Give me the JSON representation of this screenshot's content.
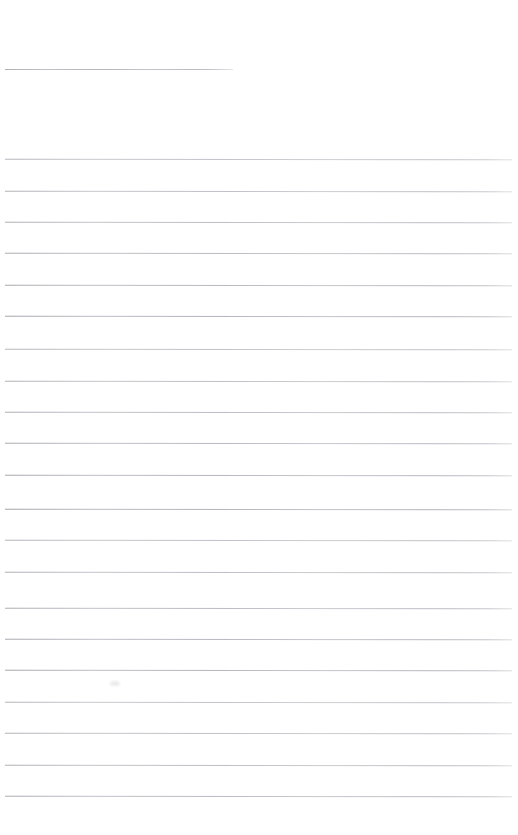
{
  "page": {
    "kind": "blank-lined-paper-scan",
    "width": 518,
    "height": 835,
    "background_color": "#ffffff",
    "text_content": "",
    "visible_text_items": []
  },
  "rules": {
    "line_color": "#c9c9ce",
    "line_thickness_px": 1,
    "spacing_px": 31.3,
    "left_margin_px": 5,
    "right_edge_px": 512,
    "header_rule": {
      "name": "header-rule",
      "x": 5,
      "y": 69,
      "width": 228,
      "color": "#c4c4ca"
    },
    "body_rules": [
      {
        "x": 5,
        "y": 159,
        "width": 507
      },
      {
        "x": 5,
        "y": 191,
        "width": 507
      },
      {
        "x": 5,
        "y": 222,
        "width": 507
      },
      {
        "x": 5,
        "y": 253,
        "width": 507
      },
      {
        "x": 5,
        "y": 285,
        "width": 507
      },
      {
        "x": 5,
        "y": 316,
        "width": 507
      },
      {
        "x": 5,
        "y": 349,
        "width": 507
      },
      {
        "x": 5,
        "y": 381,
        "width": 507
      },
      {
        "x": 5,
        "y": 412,
        "width": 507
      },
      {
        "x": 5,
        "y": 443,
        "width": 507
      },
      {
        "x": 5,
        "y": 475,
        "width": 507
      },
      {
        "x": 5,
        "y": 509,
        "width": 507
      },
      {
        "x": 5,
        "y": 540,
        "width": 507
      },
      {
        "x": 5,
        "y": 572,
        "width": 507
      },
      {
        "x": 5,
        "y": 608,
        "width": 507
      },
      {
        "x": 5,
        "y": 639,
        "width": 507
      },
      {
        "x": 5,
        "y": 670,
        "width": 507
      },
      {
        "x": 5,
        "y": 702,
        "width": 507
      },
      {
        "x": 5,
        "y": 733,
        "width": 507
      },
      {
        "x": 5,
        "y": 765,
        "width": 507
      },
      {
        "x": 5,
        "y": 796,
        "width": 507
      }
    ],
    "specks": [
      {
        "x": 110,
        "y": 681
      }
    ]
  }
}
